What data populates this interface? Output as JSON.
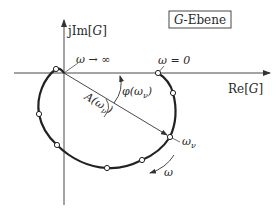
{
  "diagram": {
    "type": "nyquist-plot",
    "plane_label": {
      "prefix": "G",
      "suffix": "-Ebene"
    },
    "axes": {
      "imag_label": {
        "prefix": "jIm[",
        "var": "G",
        "suffix": "]"
      },
      "real_label": {
        "prefix": "Re[",
        "var": "G",
        "suffix": "]"
      }
    },
    "annotations": {
      "omega_inf": "ω → ∞",
      "omega_zero": "ω = 0",
      "omega_nu": "ω",
      "omega_nu_sub": "ν",
      "phase": {
        "prefix": "φ(ω",
        "sub": "ν",
        "suffix": ")"
      },
      "amplitude": {
        "prefix": "A(ω",
        "sub": "ν",
        "suffix": ")"
      },
      "direction": "ω"
    },
    "colors": {
      "curve": "#222222",
      "axes": "#333333",
      "text": "#2a2a2a",
      "background": "#ffffff"
    },
    "points": [
      {
        "x": 158,
        "y": 73,
        "label": "ω = 0"
      },
      {
        "x": 173,
        "y": 93
      },
      {
        "x": 170,
        "y": 137,
        "label": "ω_ν"
      },
      {
        "x": 142,
        "y": 160
      },
      {
        "x": 107,
        "y": 168
      },
      {
        "x": 57,
        "y": 145
      },
      {
        "x": 39,
        "y": 114
      },
      {
        "x": 56,
        "y": 69
      }
    ]
  }
}
